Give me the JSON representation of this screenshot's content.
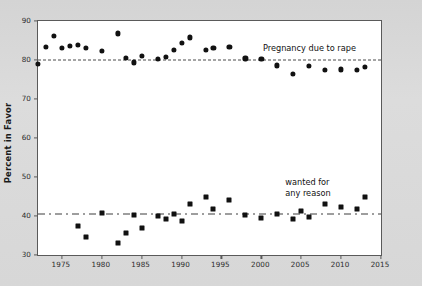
{
  "chart_data": {
    "type": "scatter",
    "title": "",
    "subtitle": "",
    "xlabel": "",
    "ylabel": "Percent in Favor",
    "xlim": [
      1972,
      2015
    ],
    "ylim": [
      30,
      90
    ],
    "xticks": [
      1975,
      1980,
      1985,
      1990,
      1995,
      2000,
      2005,
      2010,
      2015
    ],
    "yticks": [
      30,
      40,
      50,
      60,
      70,
      80,
      90
    ],
    "grid": false,
    "legend_position": "inline-annotations",
    "annotations": [
      {
        "name": "rape-series-label",
        "text": "Pregnancy due to rape",
        "x": 2000.2,
        "y": 83.2
      },
      {
        "name": "any-reason-series-label",
        "text_line1": "wanted for",
        "text_line2": "any reason",
        "x": 2003.0,
        "y": 48.6
      }
    ],
    "reference_lines": [
      {
        "name": "rape-mean-line",
        "style": "dashed",
        "value": 80.0,
        "series": "Pregnancy due to rape"
      },
      {
        "name": "any-reason-mean-line",
        "style": "dash-dot",
        "value": 40.5,
        "series": "wanted for any reason"
      }
    ],
    "series": [
      {
        "name": "Pregnancy due to rape",
        "marker": "circle",
        "color": "#111111",
        "x": [
          1972,
          1973,
          1974,
          1975,
          1976,
          1977,
          1978,
          1980,
          1982,
          1983,
          1984,
          1985,
          1987,
          1988,
          1989,
          1990,
          1991,
          1993,
          1994,
          1996,
          1998,
          2000,
          2002,
          2004,
          2006,
          2008,
          2010,
          2012,
          2013
        ],
        "y": [
          79.0,
          83.4,
          86.2,
          83.2,
          83.6,
          83.8,
          83.0,
          82.4,
          86.8,
          80.6,
          79.4,
          81.1,
          80.2,
          80.8,
          82.6,
          84.3,
          85.8,
          82.6,
          83.2,
          83.3,
          80.4,
          80.3,
          78.6,
          76.4,
          78.4,
          77.4,
          77.6,
          77.4,
          78.2
        ]
      },
      {
        "name": "wanted for any reason",
        "marker": "square",
        "color": "#111111",
        "x": [
          1977,
          1978,
          1980,
          1982,
          1983,
          1984,
          1985,
          1987,
          1988,
          1989,
          1990,
          1991,
          1993,
          1994,
          1996,
          1998,
          2000,
          2002,
          2004,
          2005,
          2006,
          2008,
          2010,
          2012,
          2013
        ],
        "y": [
          37.4,
          34.6,
          40.8,
          33.0,
          35.6,
          40.2,
          37.0,
          40.0,
          39.2,
          40.6,
          38.6,
          43.2,
          45.0,
          41.8,
          44.2,
          40.2,
          39.4,
          40.6,
          39.2,
          41.4,
          39.8,
          43.2,
          42.4,
          41.8,
          45.0
        ]
      }
    ]
  }
}
